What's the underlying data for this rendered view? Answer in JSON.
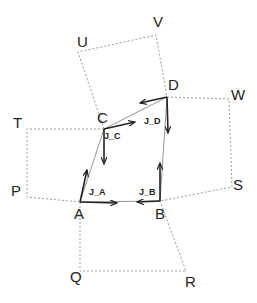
{
  "diagram": {
    "points": {
      "A": {
        "label": "A",
        "x": 80,
        "y": 202,
        "lx": 74,
        "ly": 219
      },
      "B": {
        "label": "B",
        "x": 160,
        "y": 201,
        "lx": 155,
        "ly": 219
      },
      "C": {
        "label": "C",
        "x": 104,
        "y": 129,
        "lx": 97,
        "ly": 123
      },
      "D": {
        "label": "D",
        "x": 167,
        "y": 97,
        "lx": 168,
        "ly": 90
      },
      "U": {
        "label": "U",
        "x": 78,
        "y": 52,
        "lx": 77,
        "ly": 47
      },
      "V": {
        "label": "V",
        "x": 156,
        "y": 35,
        "lx": 153,
        "ly": 27
      },
      "W": {
        "label": "W",
        "x": 229,
        "y": 99,
        "lx": 231,
        "ly": 100
      },
      "S": {
        "label": "S",
        "x": 232,
        "y": 187,
        "lx": 233,
        "ly": 190
      },
      "T": {
        "label": "T",
        "x": 27,
        "y": 129,
        "lx": 13,
        "ly": 128
      },
      "P": {
        "label": "P",
        "x": 27,
        "y": 197,
        "lx": 11,
        "ly": 196
      },
      "Q": {
        "label": "Q",
        "x": 80,
        "y": 271,
        "lx": 70,
        "ly": 282
      },
      "R": {
        "label": "R",
        "x": 186,
        "y": 271,
        "lx": 185,
        "ly": 287
      }
    },
    "joint_labels": [
      {
        "label": "J_A",
        "x": 89,
        "y": 195
      },
      {
        "label": "J_B",
        "x": 139,
        "y": 195
      },
      {
        "label": "J_C",
        "x": 104,
        "y": 139
      },
      {
        "label": "J_D",
        "x": 144,
        "y": 124
      }
    ],
    "colors": {
      "edge": "#888888",
      "dotted": "#999999",
      "arrow": "#222222"
    }
  }
}
